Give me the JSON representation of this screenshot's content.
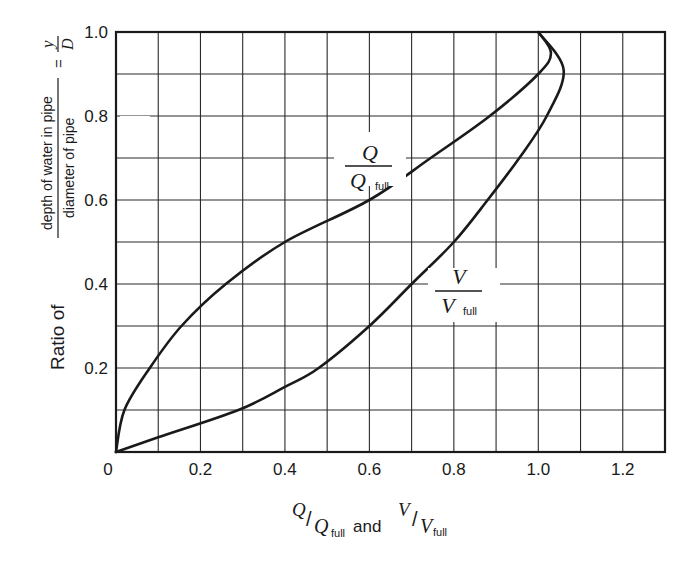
{
  "chart_data": {
    "type": "line",
    "title": "",
    "xlabel": "Q/Q_full and V/V_full",
    "ylabel": "Ratio of (depth of water in pipe / diameter of pipe) = y/D",
    "xlim": [
      0,
      1.3
    ],
    "ylim": [
      0,
      1.0
    ],
    "grid": true,
    "grid_step_x": 0.1,
    "grid_step_y": 0.1,
    "x_ticks": [
      "0",
      "0.2",
      "0.4",
      "0.6",
      "0.8",
      "1.0",
      "1.2"
    ],
    "y_ticks": [
      "0.2",
      "0.4",
      "0.6",
      "0.8",
      "1.0"
    ],
    "series": [
      {
        "name": "Q/Q_full",
        "points": [
          [
            0,
            0
          ],
          [
            0.02,
            0.1
          ],
          [
            0.08,
            0.2
          ],
          [
            0.155,
            0.3
          ],
          [
            0.26,
            0.4
          ],
          [
            0.4,
            0.5
          ],
          [
            0.6,
            0.6
          ],
          [
            0.745,
            0.7
          ],
          [
            0.885,
            0.8
          ],
          [
            1.0,
            0.9
          ],
          [
            1.03,
            0.95
          ],
          [
            1.0,
            1.0
          ]
        ]
      },
      {
        "name": "V/V_full",
        "points": [
          [
            0,
            0
          ],
          [
            0.1,
            0.035
          ],
          [
            0.29,
            0.1
          ],
          [
            0.4,
            0.155
          ],
          [
            0.48,
            0.2
          ],
          [
            0.6,
            0.3
          ],
          [
            0.7,
            0.4
          ],
          [
            0.8,
            0.5
          ],
          [
            0.88,
            0.6
          ],
          [
            0.955,
            0.7
          ],
          [
            1.02,
            0.8
          ],
          [
            1.06,
            0.91
          ],
          [
            1.0,
            1.0
          ]
        ]
      }
    ],
    "annotations": [
      {
        "label": "Q/Q_full",
        "x": 0.6,
        "y": 0.7
      },
      {
        "label": "V/V_full",
        "x": 0.8,
        "y": 0.38
      }
    ]
  },
  "labels": {
    "origin": "0",
    "y_ratio_of": "Ratio of",
    "y_numerator": "depth of water in pipe",
    "y_denominator": "diameter of pipe",
    "y_equals": "=",
    "y_var": "y",
    "d_var": "D",
    "x_q": "Q",
    "x_slash": "/",
    "x_qfull": "Q",
    "x_full": "full",
    "x_and": "and",
    "x_v": "V",
    "x_vfull": "V",
    "curve_q_num": "Q",
    "curve_q_den": "Q",
    "curve_v_num": "V",
    "curve_v_den": "V",
    "full": "full"
  },
  "colors": {
    "line": "#1a1a1a",
    "grid": "#2a2a2a",
    "background": "#ffffff"
  }
}
